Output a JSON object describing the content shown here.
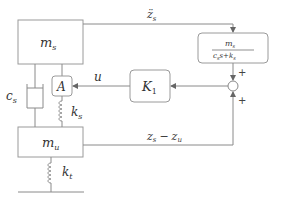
{
  "diagram": {
    "type": "quarter-car active suspension block diagram",
    "blocks": {
      "sprung_mass": {
        "label": "m",
        "sub": "s"
      },
      "unsprung_mass": {
        "label": "m",
        "sub": "u"
      },
      "actuator": {
        "label": "A"
      },
      "controller": {
        "label": "K",
        "sub": "1"
      },
      "transfer_function": {
        "numerator": {
          "label": "m",
          "sub": "s"
        },
        "denominator": "c_s s + k_s",
        "den_c": "c",
        "den_c_sub": "s",
        "den_s": "s",
        "den_plus": "+",
        "den_k": "k",
        "den_k_sub": "s"
      }
    },
    "components": {
      "damper": {
        "label": "c",
        "sub": "s"
      },
      "suspension_spring": {
        "label": "k",
        "sub": "s"
      },
      "tire_spring": {
        "label": "k",
        "sub": "t"
      }
    },
    "signals": {
      "accel": {
        "label": "z̈",
        "sub": "s"
      },
      "control": {
        "label": "u"
      },
      "deflection": {
        "a": "z",
        "a_sub": "s",
        "minus": "−",
        "b": "z",
        "b_sub": "u"
      }
    },
    "summing_junction": {
      "top_sign": "+",
      "bottom_sign": "+"
    }
  }
}
